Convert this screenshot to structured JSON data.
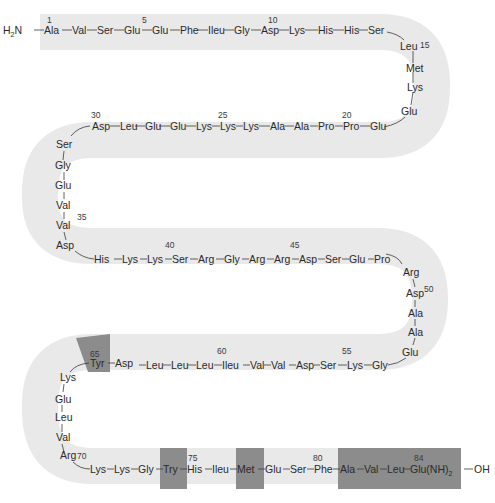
{
  "diagram": {
    "n_terminus": "H2N",
    "c_terminus": "OH",
    "colors": {
      "ribbon": "#e9e9e9",
      "highlight": "#8c8c8c",
      "text": "#2a2a2a",
      "background": "#ffffff"
    },
    "rows": [
      {
        "name": "row-1",
        "direction": "left-to-right",
        "residues": [
          {
            "pos": 1,
            "name": "Ala",
            "label": "1"
          },
          {
            "pos": 2,
            "name": "Val"
          },
          {
            "pos": 3,
            "name": "Ser"
          },
          {
            "pos": 4,
            "name": "Glu"
          },
          {
            "pos": 5,
            "name": "Glu",
            "label": "5"
          },
          {
            "pos": 6,
            "name": "Phe"
          },
          {
            "pos": 7,
            "name": "Ileu"
          },
          {
            "pos": 8,
            "name": "Gly"
          },
          {
            "pos": 9,
            "name": "Asp"
          },
          {
            "pos": 10,
            "name": "Lys",
            "label": "10"
          },
          {
            "pos": 11,
            "name": "His"
          },
          {
            "pos": 12,
            "name": "His"
          },
          {
            "pos": 13,
            "name": "Ser"
          },
          {
            "pos": 14,
            "name": "Leu"
          }
        ]
      },
      {
        "name": "turn-1",
        "direction": "down-right",
        "residues": [
          {
            "pos": 15,
            "name": "Leu",
            "label": "15"
          },
          {
            "pos": 16,
            "name": "Met"
          },
          {
            "pos": 17,
            "name": "Lys"
          },
          {
            "pos": 18,
            "name": "Glu"
          }
        ]
      },
      {
        "name": "row-2",
        "direction": "right-to-left",
        "residues": [
          {
            "pos": 19,
            "name": "Glu"
          },
          {
            "pos": 20,
            "name": "Pro",
            "label": "20"
          },
          {
            "pos": 21,
            "name": "Pro"
          },
          {
            "pos": 22,
            "name": "Ala"
          },
          {
            "pos": 23,
            "name": "Ala"
          },
          {
            "pos": 24,
            "name": "Lys"
          },
          {
            "pos": 25,
            "name": "Lys",
            "label": "25"
          },
          {
            "pos": 26,
            "name": "Lys"
          },
          {
            "pos": 27,
            "name": "Glu"
          },
          {
            "pos": 28,
            "name": "Glu"
          },
          {
            "pos": 29,
            "name": "Leu"
          },
          {
            "pos": 30,
            "name": "Asp",
            "label": "30"
          }
        ]
      },
      {
        "name": "turn-2",
        "direction": "down-left",
        "residues": [
          {
            "pos": 31,
            "name": "Ser"
          },
          {
            "pos": 32,
            "name": "Gly"
          },
          {
            "pos": 33,
            "name": "Glu"
          },
          {
            "pos": 34,
            "name": "Val"
          },
          {
            "pos": 35,
            "name": "Val",
            "label": "35"
          },
          {
            "pos": 36,
            "name": "Asp"
          }
        ]
      },
      {
        "name": "row-3",
        "direction": "left-to-right",
        "residues": [
          {
            "pos": 37,
            "name": "His"
          },
          {
            "pos": 38,
            "name": "Lys"
          },
          {
            "pos": 39,
            "name": "Lys"
          },
          {
            "pos": 40,
            "name": "Ser",
            "label": "40"
          },
          {
            "pos": 41,
            "name": "Arg"
          },
          {
            "pos": 42,
            "name": "Gly"
          },
          {
            "pos": 43,
            "name": "Arg"
          },
          {
            "pos": 44,
            "name": "Arg"
          },
          {
            "pos": 45,
            "name": "Asp",
            "label": "45"
          },
          {
            "pos": 46,
            "name": "Ser"
          },
          {
            "pos": 47,
            "name": "Glu"
          },
          {
            "pos": 48,
            "name": "Pro"
          }
        ]
      },
      {
        "name": "turn-3",
        "direction": "down-right",
        "residues": [
          {
            "pos": 49,
            "name": "Arg"
          },
          {
            "pos": 50,
            "name": "Asp",
            "label": "50"
          },
          {
            "pos": 51,
            "name": "Ala"
          },
          {
            "pos": 52,
            "name": "Ala"
          },
          {
            "pos": 53,
            "name": "Glu"
          }
        ]
      },
      {
        "name": "row-4",
        "direction": "right-to-left",
        "residues": [
          {
            "pos": 54,
            "name": "Gly"
          },
          {
            "pos": 55,
            "name": "Lys",
            "label": "55"
          },
          {
            "pos": 56,
            "name": "Ser"
          },
          {
            "pos": 57,
            "name": "Asp"
          },
          {
            "pos": 58,
            "name": "Val"
          },
          {
            "pos": 59,
            "name": "Val"
          },
          {
            "pos": 60,
            "name": "Ileu",
            "label": "60"
          },
          {
            "pos": 61,
            "name": "Leu"
          },
          {
            "pos": 62,
            "name": "Leu"
          },
          {
            "pos": 63,
            "name": "Leu"
          },
          {
            "pos": 64,
            "name": "Asp"
          },
          {
            "pos": 65,
            "name": "Tyr",
            "label": "65",
            "highlighted": true
          }
        ]
      },
      {
        "name": "turn-4",
        "direction": "down-left",
        "residues": [
          {
            "pos": 66,
            "name": "Lys"
          },
          {
            "pos": 67,
            "name": "Glu"
          },
          {
            "pos": 68,
            "name": "Leu"
          },
          {
            "pos": 69,
            "name": "Val"
          },
          {
            "pos": 70,
            "name": "Arg",
            "label": "70"
          }
        ]
      },
      {
        "name": "row-5",
        "direction": "left-to-right",
        "residues": [
          {
            "pos": 71,
            "name": "Lys"
          },
          {
            "pos": 72,
            "name": "Lys"
          },
          {
            "pos": 73,
            "name": "Gly"
          },
          {
            "pos": 74,
            "name": "Try",
            "highlighted": true
          },
          {
            "pos": 75,
            "name": "His",
            "label": "75"
          },
          {
            "pos": 76,
            "name": "Ileu"
          },
          {
            "pos": 77,
            "name": "Met",
            "highlighted": true
          },
          {
            "pos": 78,
            "name": "Glu"
          },
          {
            "pos": 79,
            "name": "Ser"
          },
          {
            "pos": 80,
            "name": "Phe",
            "label": "80"
          },
          {
            "pos": 81,
            "name": "Ala",
            "highlighted": true
          },
          {
            "pos": 82,
            "name": "Val",
            "highlighted": true
          },
          {
            "pos": 83,
            "name": "Leu",
            "highlighted": true
          },
          {
            "pos": 84,
            "name": "Glu(NH)2",
            "label": "84",
            "highlighted": true
          }
        ]
      }
    ]
  },
  "labels": {
    "r1": "Ala",
    "r2": "Val",
    "r3": "Ser",
    "r4": "Glu",
    "r5": "Glu",
    "r6": "Phe",
    "r7": "Ileu",
    "r8": "Gly",
    "r9": "Asp",
    "r10": "Lys",
    "r11": "His",
    "r12": "His",
    "r13": "Ser",
    "r14": "Leu",
    "r15": "Leu",
    "r16": "Met",
    "r17": "Lys",
    "r18": "Glu",
    "r19": "Glu",
    "r20": "Pro",
    "r21": "Pro",
    "r22": "Ala",
    "r23": "Ala",
    "r24": "Lys",
    "r25": "Lys",
    "r26": "Lys",
    "r27": "Glu",
    "r28": "Glu",
    "r29": "Leu",
    "r30": "Asp",
    "r31": "Ser",
    "r32": "Gly",
    "r33": "Glu",
    "r34": "Val",
    "r35": "Val",
    "r36": "Asp",
    "r37": "His",
    "r38": "Lys",
    "r39": "Lys",
    "r40": "Ser",
    "r41": "Arg",
    "r42": "Gly",
    "r43": "Arg",
    "r44": "Arg",
    "r45": "Asp",
    "r46": "Ser",
    "r47": "Glu",
    "r48": "Pro",
    "r49": "Arg",
    "r50": "Asp",
    "r51": "Ala",
    "r52": "Ala",
    "r53": "Glu",
    "r54": "Gly",
    "r55": "Lys",
    "r56": "Ser",
    "r57": "Asp",
    "r58": "Val",
    "r59": "Val",
    "r60": "Ileu",
    "r61": "Leu",
    "r62": "Leu",
    "r63": "Leu",
    "r64": "Asp",
    "r65": "Tyr",
    "r66": "Lys",
    "r67": "Glu",
    "r68": "Leu",
    "r69": "Val",
    "r70": "Arg",
    "r71": "Lys",
    "r72": "Lys",
    "r73": "Gly",
    "r74": "Try",
    "r75": "His",
    "r76": "Ileu",
    "r77": "Met",
    "r78": "Glu",
    "r79": "Ser",
    "r80": "Phe",
    "r81": "Ala",
    "r82": "Val",
    "r83": "Leu",
    "r84": "Glu(NH)",
    "r84_sub": "2",
    "n1": "1",
    "n5": "5",
    "n10": "10",
    "n15": "15",
    "n20": "20",
    "n25": "25",
    "n30": "30",
    "n35": "35",
    "n40": "40",
    "n45": "45",
    "n50": "50",
    "n55": "55",
    "n60": "60",
    "n65": "65",
    "n70": "70",
    "n75": "75",
    "n80": "80",
    "n84": "84",
    "nterm": "H",
    "nterm_sub": "2",
    "nterm_n": "N",
    "cterm": "OH"
  }
}
